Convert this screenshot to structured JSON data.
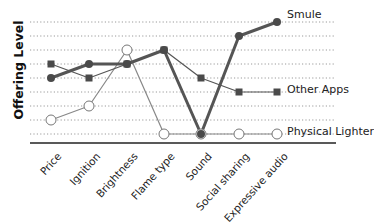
{
  "chart_data": {
    "type": "line",
    "title": "",
    "xlabel": "",
    "ylabel": "Offering Level",
    "categories": [
      "Price",
      "Ignition",
      "Brightness",
      "Flame type",
      "Sound",
      "Social sharing",
      "Expressive audio"
    ],
    "ylim": [
      0,
      8
    ],
    "grid": true,
    "legend_position": "inline-right",
    "series": [
      {
        "name": "Smule",
        "marker": "filled-circle",
        "line": "thick",
        "color": "#555555",
        "values": [
          4,
          5,
          5,
          6,
          0,
          7,
          8
        ]
      },
      {
        "name": "Other Apps",
        "marker": "filled-square",
        "line": "thin",
        "color": "#555555",
        "values": [
          5,
          4,
          5,
          6,
          4,
          3,
          3
        ]
      },
      {
        "name": "Physical Lighter",
        "marker": "open-circle",
        "line": "thin",
        "color": "#888888",
        "values": [
          1,
          2,
          6,
          0,
          0,
          0,
          0
        ]
      }
    ]
  }
}
